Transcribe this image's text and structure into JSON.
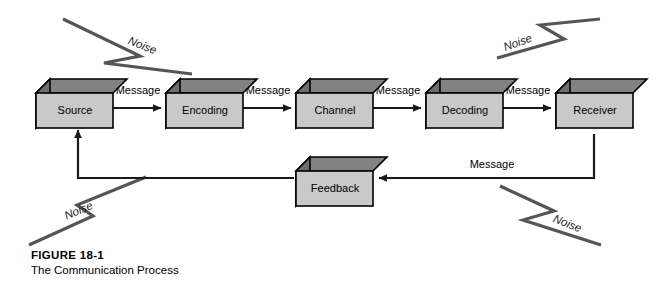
{
  "figure": {
    "caption_title": "FIGURE 18-1",
    "caption_subtitle": "The Communication Process"
  },
  "colors": {
    "box_front": "#c9c9c9",
    "box_top": "#828282",
    "box_side": "#6e6e6e",
    "outline": "#000000",
    "line": "#1a1a1a",
    "noise_line": "#555555",
    "background": "#ffffff"
  },
  "diagram": {
    "type": "flow-diagram",
    "nodes": [
      {
        "id": "source",
        "label": "Source",
        "x": 36,
        "y": 78
      },
      {
        "id": "encoding",
        "label": "Encoding",
        "x": 166,
        "y": 78
      },
      {
        "id": "channel",
        "label": "Channel",
        "x": 296,
        "y": 78
      },
      {
        "id": "decoding",
        "label": "Decoding",
        "x": 426,
        "y": 78
      },
      {
        "id": "receiver",
        "label": "Receiver",
        "x": 556,
        "y": 78
      },
      {
        "id": "feedback",
        "label": "Feedback",
        "x": 296,
        "y": 156
      }
    ],
    "edges": [
      {
        "id": "source-encoding",
        "label": "Message",
        "from": "source",
        "to": "encoding"
      },
      {
        "id": "encoding-channel",
        "label": "Message",
        "from": "encoding",
        "to": "channel"
      },
      {
        "id": "channel-decoding",
        "label": "Message",
        "from": "channel",
        "to": "decoding"
      },
      {
        "id": "decoding-receiver",
        "label": "Message",
        "from": "decoding",
        "to": "receiver"
      },
      {
        "id": "receiver-feedback",
        "label": "Message",
        "from": "receiver",
        "to": "feedback"
      },
      {
        "id": "feedback-source",
        "label": "",
        "from": "feedback",
        "to": "source"
      }
    ],
    "noise_markers": [
      {
        "id": "noise-top-left",
        "label": "Noise",
        "position": "top-left"
      },
      {
        "id": "noise-top-right",
        "label": "Noise",
        "position": "top-right"
      },
      {
        "id": "noise-bottom-left",
        "label": "Noise",
        "position": "bottom-left"
      },
      {
        "id": "noise-bottom-right",
        "label": "Noise",
        "position": "bottom-right"
      }
    ]
  }
}
